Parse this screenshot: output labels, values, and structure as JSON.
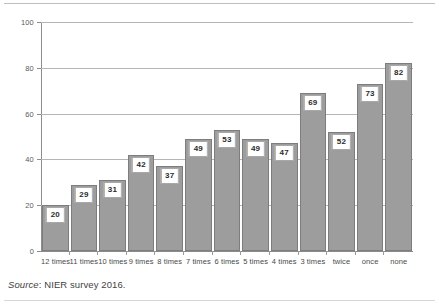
{
  "chart_data": {
    "type": "bar",
    "title": "",
    "subtitle": "",
    "xlabel": "",
    "ylabel": "",
    "categories": [
      "12 times",
      "11 times",
      "10 times",
      "9 times",
      "8 times",
      "7 times",
      "6 times",
      "5 times",
      "4 times",
      "3 times",
      "twice",
      "once",
      "none"
    ],
    "values": [
      20,
      29,
      31,
      42,
      37,
      49,
      53,
      49,
      47,
      69,
      52,
      73,
      82
    ],
    "ylim": [
      0,
      100
    ],
    "yticks": [
      0,
      20,
      40,
      60,
      80,
      100
    ],
    "ytick_labels": [
      "0",
      "20",
      "40",
      "60",
      "80",
      "100"
    ],
    "grid": true,
    "legend": false,
    "legend_position": "none",
    "series": [
      {
        "name": "",
        "values": [
          20,
          29,
          31,
          42,
          37,
          49,
          53,
          49,
          47,
          69,
          52,
          73,
          82
        ]
      }
    ],
    "bar_color": "#9d9d9d",
    "bar_border_color": "#7d7d7d",
    "grid_color": "#b5b5b5",
    "axis_color": "#8c8c8c",
    "label_box_fill": "#ffffff",
    "label_box_border": "#a8a8a8",
    "data_labels": [
      "20",
      "29",
      "31",
      "42",
      "37",
      "49",
      "53",
      "49",
      "47",
      "69",
      "52",
      "73",
      "82"
    ]
  },
  "source_note": {
    "lead": "Source",
    "text": ": NIER survey 2016."
  }
}
